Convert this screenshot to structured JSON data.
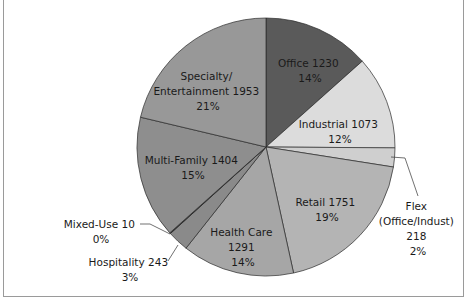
{
  "chart_data": {
    "type": "pie",
    "title": "",
    "start_angle_deg": 0,
    "direction": "clockwise",
    "categories": [
      "Office",
      "Industrial",
      "Flex (Office/Indust)",
      "Retail",
      "Health Care",
      "Hospitality",
      "Mixed-Use",
      "Multi-Family",
      "Specialty/ Entertainment"
    ],
    "values": [
      1230,
      1073,
      218,
      1751,
      1291,
      243,
      10,
      1404,
      1953
    ],
    "percents": [
      "14%",
      "12%",
      "2%",
      "19%",
      "14%",
      "3%",
      "0%",
      "15%",
      "21%"
    ],
    "colors": [
      "#5a5a5a",
      "#dcdcdc",
      "#cfcfcf",
      "#b4b4b4",
      "#a6a6a6",
      "#8a8a8a",
      "#1a1a1a",
      "#8e8e8e",
      "#989898"
    ],
    "labels": [
      {
        "lines": [
          "Office 1230",
          "14%"
        ]
      },
      {
        "lines": [
          "Industrial 1073",
          "12%"
        ]
      },
      {
        "lines": [
          "Flex",
          "(Office/Indust)",
          "218",
          "2%"
        ]
      },
      {
        "lines": [
          "Retail 1751",
          "19%"
        ]
      },
      {
        "lines": [
          "Health Care",
          "1291",
          "14%"
        ]
      },
      {
        "lines": [
          "Hospitality 243",
          "3%"
        ]
      },
      {
        "lines": [
          "Mixed-Use 10",
          "0%"
        ]
      },
      {
        "lines": [
          "Multi-Family 1404",
          "15%"
        ]
      },
      {
        "lines": [
          "Specialty/",
          "Entertainment 1953",
          "21%"
        ]
      }
    ],
    "legend": "none (data labels on slices)"
  }
}
